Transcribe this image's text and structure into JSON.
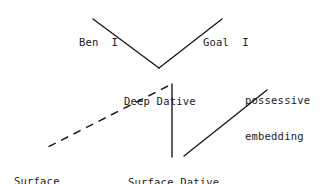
{
  "diagram": {
    "type": "linguistic-case-tree",
    "width": 325,
    "height": 184,
    "background_color": "#ffffff",
    "line_color": "#1a1a1a",
    "nodes": [
      {
        "id": "ben",
        "label": "Ben  I",
        "lines": [
          "Ben  I"
        ],
        "x": 79,
        "y": 12
      },
      {
        "id": "goal",
        "label": "Goal  I",
        "lines": [
          "Goal  I"
        ],
        "x": 203,
        "y": 12
      },
      {
        "id": "deep_dative",
        "label": "Deep Dative",
        "lines": [
          "Deep Dative"
        ],
        "x": 124,
        "y": 71
      },
      {
        "id": "possessive_embedding",
        "label": "possessive embedding",
        "lines": [
          "possessive",
          "embedding"
        ],
        "x": 245,
        "y": 70
      },
      {
        "id": "surface_subject",
        "label": "Surface Subject",
        "lines": [
          "Surface",
          "Subject"
        ],
        "x": 14,
        "y": 151
      },
      {
        "id": "surface_dative",
        "label": "Surface Dative",
        "lines": [
          "Surface Dative"
        ],
        "x": 128,
        "y": 152
      }
    ],
    "edges": [
      {
        "id": "ben-to-deep-dative",
        "from": "ben",
        "to": "deep_dative",
        "style": "solid",
        "x1": 93,
        "y1": 19,
        "x2": 159,
        "y2": 68
      },
      {
        "id": "goal-to-deep-dative",
        "from": "goal",
        "to": "deep_dative",
        "style": "solid",
        "x1": 222,
        "y1": 19,
        "x2": 159,
        "y2": 68
      },
      {
        "id": "deep-dative-to-surface-subject",
        "from": "deep_dative",
        "to": "surface_subject",
        "style": "dashed",
        "x1": 168,
        "y1": 86,
        "x2": 44,
        "y2": 149
      },
      {
        "id": "deep-dative-to-surface-dative",
        "from": "deep_dative",
        "to": "surface_dative",
        "style": "solid",
        "x1": 172,
        "y1": 84,
        "x2": 172,
        "y2": 157
      },
      {
        "id": "surface-dative-to-possessive-embedding",
        "from": "surface_dative",
        "to": "possessive_embedding",
        "style": "solid",
        "x1": 184,
        "y1": 156,
        "x2": 267,
        "y2": 90
      }
    ]
  }
}
